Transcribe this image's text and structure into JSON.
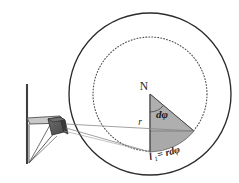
{
  "figure": {
    "width": 239,
    "height": 183,
    "background": "#ffffff"
  },
  "labels": {
    "apex": "N",
    "radius": "r",
    "angle": "dφ",
    "arc_length_main": "l",
    "arc_length_sub": "1",
    "arc_length_rest": "= rdφ",
    "arc_length_full": "l₁ = rdφ"
  },
  "colors": {
    "outline": "#2b2b2b",
    "dotted_circle": "#555555",
    "wedge_fill": "#a9a9a9",
    "wedge_fill_light": "#b8b8b8",
    "projector_box": "#5a5a5a",
    "projector_box_side": "#3d3d3d",
    "bracket_stroke": "#4a4a4a",
    "ray": "#777777",
    "label_text": "#1a1a1a"
  },
  "geometry": {
    "outer_circle": {
      "cx": 150,
      "cy": 94,
      "r": 81
    },
    "inner_dotted_circle": {
      "cx": 150,
      "cy": 94,
      "r": 57
    },
    "wedge_apex": {
      "x": 150,
      "y": 94
    },
    "wedge_point_bottom": {
      "x": 150,
      "y": 152
    },
    "wedge_point_right": {
      "x": 194,
      "y": 131
    },
    "projector": {
      "x": 53,
      "y": 121
    },
    "wall_post": {
      "x": 26,
      "y_top": 84,
      "y_bottom": 163
    },
    "shelf": {
      "x_left": 26,
      "x_right": 63,
      "y": 120
    }
  },
  "elements": {
    "wall_post_name": "wall-post",
    "shelf_name": "mounting-shelf",
    "strut_name": "support-strut",
    "projector_name": "light-source-box",
    "ray_upper_name": "light-ray-upper",
    "ray_lower_name": "light-ray-lower",
    "outer_circle_name": "outer-sphere-outline",
    "inner_circle_name": "inner-dotted-circle",
    "wedge_name": "shaded-sector-wedge"
  }
}
